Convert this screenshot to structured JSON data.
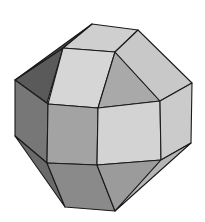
{
  "figure": {
    "colors": {
      "background": "#ffffff",
      "edge": "#1a1a1a",
      "top": "#cfcfcf",
      "top_left_square": "#d6d6d6",
      "top_tri": "#a9a9a9",
      "upper_right": "#c8c8c8",
      "upper_left_dark": "#5a5a5a",
      "front_left": "#a3a3a3",
      "front_center": "#d3d3d3",
      "front_right": "#cbcbcb",
      "left_side": "#777777",
      "bottom_left": "#8a8a8a",
      "bottom_center": "#9b9b9b",
      "bottom_right": "#b5b5b5",
      "bottom_far_left": "#6a6a6a"
    }
  }
}
